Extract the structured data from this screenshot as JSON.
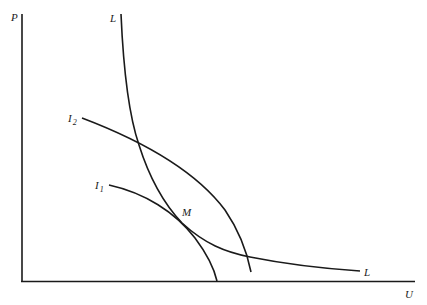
{
  "diagram": {
    "axes": {
      "y_label": "P",
      "x_label": "U"
    },
    "curves": [
      {
        "id": "L",
        "label": "L",
        "label_end": "L",
        "description": "downward-sloping curve from top to lower right"
      },
      {
        "id": "I2",
        "label": "I",
        "subscript": "2",
        "description": "outer concave curve"
      },
      {
        "id": "I1",
        "label": "I",
        "subscript": "1",
        "description": "inner concave curve, tangent to L at M"
      }
    ],
    "points": [
      {
        "id": "M",
        "label": "M",
        "description": "tangency of L and I1"
      }
    ],
    "colors": {
      "line": "#1a1a1a",
      "background": "#ffffff"
    }
  }
}
